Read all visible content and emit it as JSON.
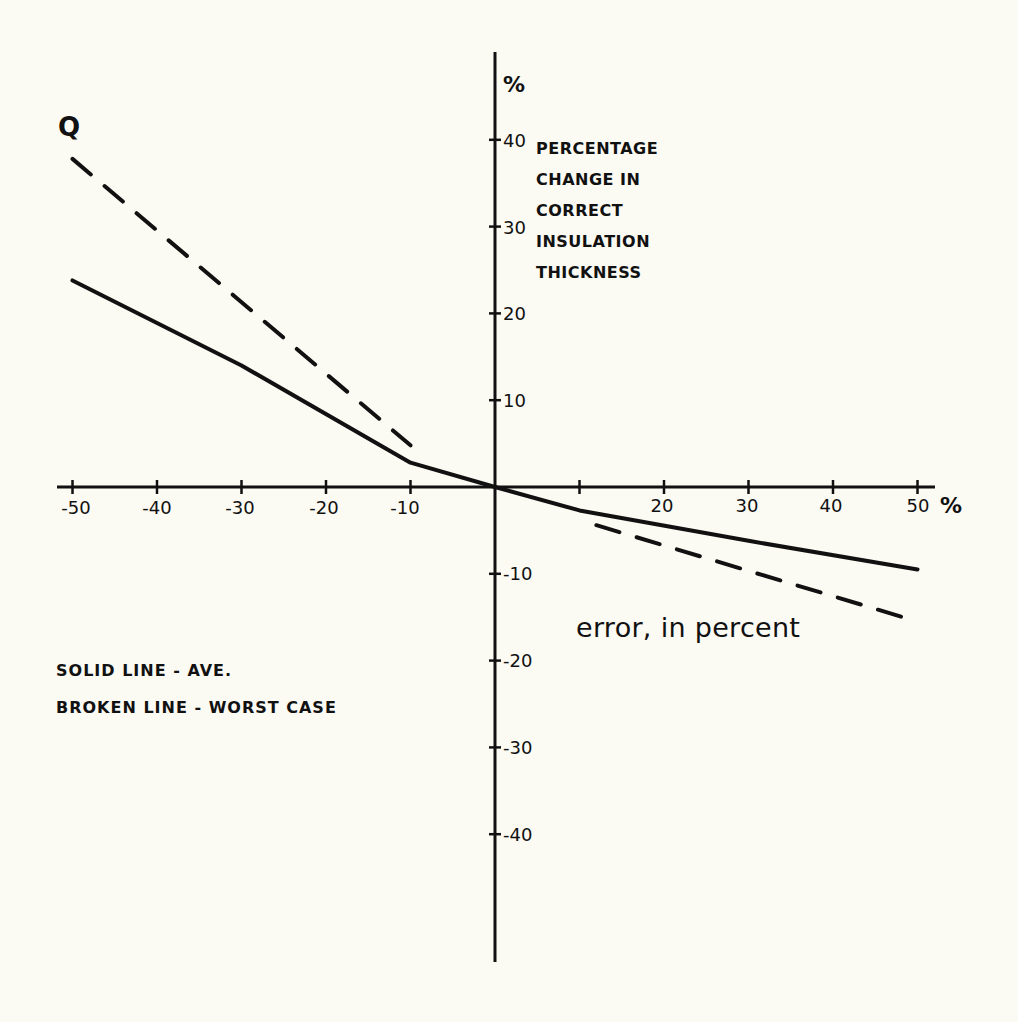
{
  "chart_data": {
    "type": "line",
    "title": "",
    "curve_label": "Q",
    "xlabel": "error, in percent",
    "x_unit": "%",
    "ylabel": "PERCENTAGE CHANGE IN CORRECT INSULATION THICKNESS",
    "ylabel_lines": [
      "PERCENTAGE",
      "CHANGE IN",
      "CORRECT",
      "INSULATION",
      "THICKNESS"
    ],
    "y_unit": "%",
    "xlim": [
      -52,
      52
    ],
    "ylim": [
      -55,
      50
    ],
    "grid": false,
    "x_ticks": [
      -50,
      -40,
      -30,
      -20,
      -10,
      10,
      20,
      30,
      40,
      50
    ],
    "x_tick_labels": [
      "-50",
      "-40",
      "-30",
      "-20",
      "-10",
      "",
      "20",
      "30",
      "40",
      "50"
    ],
    "y_ticks": [
      40,
      30,
      20,
      10,
      -10,
      -20,
      -30,
      -40
    ],
    "y_tick_labels": [
      "40",
      "30",
      "20",
      "10",
      "-10",
      "-20",
      "-30",
      "-40"
    ],
    "legend": [
      "SOLID LINE - AVE.",
      "BROKEN LINE - WORST CASE"
    ],
    "series": [
      {
        "name": "Average (solid line)",
        "style": "solid",
        "x": [
          -50,
          -30,
          -10,
          0,
          10,
          30,
          50
        ],
        "y": [
          23.8,
          14.0,
          2.8,
          0,
          -2.7,
          -6.2,
          -9.5
        ]
      },
      {
        "name": "Worst case (broken line, error < 0)",
        "style": "dashed",
        "x": [
          -50,
          -10
        ],
        "y": [
          37.8,
          4.8
        ]
      },
      {
        "name": "Worst case (broken line, error > 0)",
        "style": "dashed",
        "x": [
          12,
          50
        ],
        "y": [
          -4.4,
          -15.5
        ]
      }
    ]
  },
  "labels": {
    "q": "Q",
    "y_unit": "%",
    "x_unit": "%",
    "xlabel": "error, in percent",
    "ylabel_lines": [
      "PERCENTAGE",
      "CHANGE IN",
      "CORRECT",
      "INSULATION",
      "THICKNESS"
    ],
    "legend": [
      "SOLID LINE - AVE.",
      "BROKEN LINE - WORST CASE"
    ],
    "x_ticks": [
      "-50",
      "-40",
      "-30",
      "-20",
      "-10",
      "20",
      "30",
      "40",
      "50"
    ],
    "y_ticks": [
      "40",
      "30",
      "20",
      "10",
      "-10",
      "-20",
      "-30",
      "-40"
    ]
  },
  "colors": {
    "background": "#fbfaf3",
    "ink": "#111111"
  }
}
